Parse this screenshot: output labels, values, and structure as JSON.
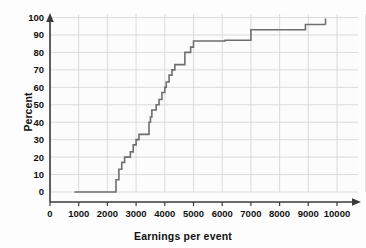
{
  "chart_data": {
    "type": "line",
    "subtype": "step-ecdf",
    "title": "",
    "xlabel": "Earnings per event",
    "ylabel": "Percent",
    "xlim": [
      0,
      10800
    ],
    "ylim": [
      0,
      105
    ],
    "xticks": [
      0,
      1000,
      2000,
      3000,
      4000,
      5000,
      6000,
      7000,
      8000,
      9000,
      10000
    ],
    "xtick_labels": [
      "0",
      "1000",
      "2000",
      "3000",
      "4000",
      "5000",
      "6000",
      "7000",
      "8000",
      "9000",
      "10000"
    ],
    "yticks": [
      0,
      10,
      20,
      30,
      40,
      50,
      60,
      70,
      80,
      90,
      100
    ],
    "ytick_labels": [
      "0",
      "10",
      "20",
      "30",
      "40",
      "50",
      "60",
      "70",
      "80",
      "90",
      "100"
    ],
    "grid": true,
    "grid_color": "#d8d8d8",
    "line_color": "#6e6e6e",
    "line_width": 1.6,
    "background": "#fcfcfc",
    "axis_color": "#3a3a3a",
    "legend": "none",
    "x": [
      850,
      2250,
      2300,
      2400,
      2500,
      2600,
      2700,
      2800,
      2900,
      3000,
      3100,
      3400,
      3450,
      3500,
      3550,
      3600,
      3700,
      3800,
      3900,
      4000,
      4050,
      4150,
      4250,
      4350,
      4500,
      4700,
      4900,
      5000,
      6000,
      6100,
      6900,
      7000,
      8800,
      8900,
      9600
    ],
    "y": [
      0,
      0,
      7,
      13,
      17,
      20,
      20,
      23,
      27,
      30,
      33,
      33,
      40,
      43,
      47,
      47,
      50,
      53,
      57,
      60,
      63,
      67,
      70,
      73,
      73,
      80,
      83,
      86.5,
      86.5,
      87,
      87,
      93,
      93,
      96,
      96
    ],
    "series": [
      {
        "name": "Cumulative percent",
        "points": [
          {
            "x": 850,
            "y": 0
          },
          {
            "x": 2250,
            "y": 0
          },
          {
            "x": 2300,
            "y": 7
          },
          {
            "x": 2400,
            "y": 13
          },
          {
            "x": 2500,
            "y": 17
          },
          {
            "x": 2600,
            "y": 20
          },
          {
            "x": 2800,
            "y": 23
          },
          {
            "x": 2900,
            "y": 27
          },
          {
            "x": 3000,
            "y": 30
          },
          {
            "x": 3100,
            "y": 33
          },
          {
            "x": 3400,
            "y": 33
          },
          {
            "x": 3450,
            "y": 40
          },
          {
            "x": 3500,
            "y": 43
          },
          {
            "x": 3550,
            "y": 47
          },
          {
            "x": 3700,
            "y": 50
          },
          {
            "x": 3800,
            "y": 53
          },
          {
            "x": 3900,
            "y": 57
          },
          {
            "x": 4000,
            "y": 60
          },
          {
            "x": 4050,
            "y": 63
          },
          {
            "x": 4150,
            "y": 67
          },
          {
            "x": 4250,
            "y": 70
          },
          {
            "x": 4350,
            "y": 73
          },
          {
            "x": 4500,
            "y": 73
          },
          {
            "x": 4700,
            "y": 80
          },
          {
            "x": 4900,
            "y": 83
          },
          {
            "x": 5000,
            "y": 86.5
          },
          {
            "x": 6000,
            "y": 86.5
          },
          {
            "x": 6100,
            "y": 87
          },
          {
            "x": 6900,
            "y": 87
          },
          {
            "x": 7000,
            "y": 93
          },
          {
            "x": 8800,
            "y": 93
          },
          {
            "x": 8900,
            "y": 96
          },
          {
            "x": 9600,
            "y": 96
          }
        ]
      }
    ]
  }
}
